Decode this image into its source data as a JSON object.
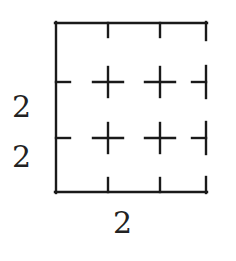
{
  "figure": {
    "name": "square-grid-dimension-diagram",
    "stroke_color": "#1a1a1a",
    "background_color": "#ffffff",
    "stroke_width": 2.2,
    "square": {
      "left": 55,
      "top": 22,
      "right": 207,
      "bottom": 193
    },
    "grid": {
      "columns": 3,
      "rows": 3,
      "x_divisions": [
        108,
        160
      ],
      "y_divisions": [
        82,
        138
      ]
    },
    "ticks": {
      "length": 13,
      "top_edge": [
        108,
        160
      ],
      "bottom_edge": [
        108,
        160
      ],
      "left_edge": [
        82,
        138
      ],
      "right_edge": [
        82,
        138
      ]
    },
    "crosshairs": {
      "arm_length": 15,
      "points": [
        {
          "x": 108,
          "y": 82
        },
        {
          "x": 160,
          "y": 82
        },
        {
          "x": 108,
          "y": 138
        },
        {
          "x": 160,
          "y": 138
        }
      ]
    },
    "right_edge_gaps": [
      {
        "from": 22,
        "to": 66
      },
      {
        "from": 98,
        "to": 122
      },
      {
        "from": 154,
        "to": 177
      }
    ]
  },
  "labels": {
    "left_upper": "2",
    "left_lower": "2",
    "bottom": "2"
  }
}
